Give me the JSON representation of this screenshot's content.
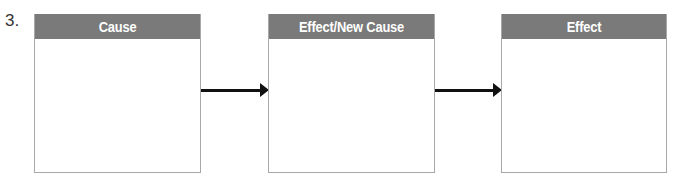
{
  "item_number": "3.",
  "boxes": [
    {
      "label": "Cause"
    },
    {
      "label": "Effect/New Cause"
    },
    {
      "label": "Effect"
    }
  ],
  "colors": {
    "header_bg": "#7a7a7a",
    "header_text": "#ffffff",
    "border": "#a8a8a8",
    "arrow": "#111111"
  }
}
